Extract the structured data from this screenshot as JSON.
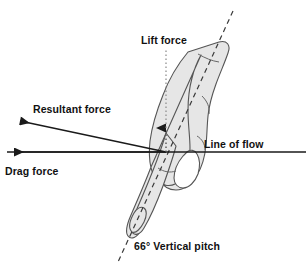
{
  "figure": {
    "type": "force-vector-diagram",
    "background_color": "#ffffff",
    "hand_fill_color": "#e6e6e6",
    "hand_stroke_color": "#4d4d4d",
    "line_color": "#1a1a1a"
  },
  "labels": {
    "lift_force": "Lift force",
    "resultant_force": "Resultant force",
    "drag_force": "Drag force",
    "line_of_flow": "Line of flow",
    "vertical_pitch": "66° Vertical pitch"
  },
  "vectors": [
    {
      "name": "lift-force",
      "label": "Lift force",
      "style": "dotted",
      "direction": "up",
      "origin": [
        166,
        152
      ],
      "tip": [
        166,
        118
      ]
    },
    {
      "name": "resultant-force",
      "label": "Resultant force",
      "style": "solid",
      "direction": "up-left",
      "origin": [
        166,
        152
      ],
      "tip": [
        13,
        120
      ]
    },
    {
      "name": "drag-force",
      "label": "Drag force",
      "style": "solid",
      "direction": "left",
      "origin": [
        166,
        152
      ],
      "tip": [
        7,
        152
      ]
    },
    {
      "name": "line-of-flow",
      "label": "Line of flow",
      "style": "solid",
      "direction": "horizontal",
      "origin": [
        7,
        152
      ],
      "tip": [
        306,
        152
      ]
    },
    {
      "name": "pitch-axis",
      "label": "66° Vertical pitch",
      "style": "dashed",
      "direction": "hand-long-axis",
      "origin": [
        233,
        11
      ],
      "tip": [
        118,
        262
      ]
    }
  ],
  "measurements": {
    "vertical_pitch_degrees": 66,
    "pitch_unit": "°"
  }
}
